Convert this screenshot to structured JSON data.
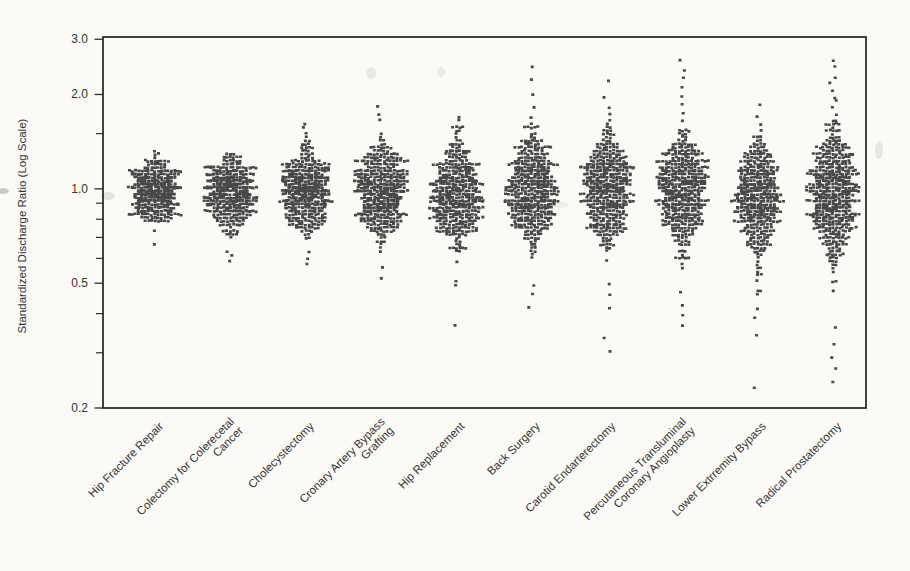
{
  "figure": {
    "background": "#fbfaf7",
    "frame_color": "#2d2d2d",
    "dot_color": "#3a3a3a",
    "text_color": "#333333",
    "ylabel": "Standardized Discharge Ratio (Log Scale)"
  },
  "chart_data": {
    "type": "beeswarm",
    "title": "",
    "xlabel": "",
    "ylabel": "Standardized Discharge Ratio (Log Scale)",
    "yscale": "log10",
    "ylim": [
      0.2,
      3.0
    ],
    "y_axis": {
      "ticks": [
        {
          "label": "3.0",
          "value": 3.0
        },
        {
          "label": "2.0",
          "value": 2.0
        },
        {
          "label": "1.0",
          "value": 1.0
        },
        {
          "label": "0.5",
          "value": 0.5
        },
        {
          "label": "0.2",
          "value": 0.2
        }
      ],
      "minor_ticks": [
        1.5,
        0.9,
        0.8,
        0.7,
        0.6,
        0.4,
        0.3
      ]
    },
    "categories": [
      "Hip Fracture Repair",
      "Colectomy for Colerecetal Cancer",
      "Cholecystectomy",
      "Cronary Artery Bypass Grafting",
      "Hip Replacement",
      "Back Surgery",
      "Carotid Endarterectomy",
      "Percutaneous Transluminal Coronary Angioplasty",
      "Lower Extrremity Bypass",
      "Radical Prostatectomy"
    ],
    "series": [
      {
        "label": "Hip Fracture Repair",
        "lines": [
          "Hip Fracture Repair"
        ],
        "n": 460,
        "center": 0.985,
        "sigma": 0.048,
        "dense": [
          0.78,
          1.31
        ],
        "high": [],
        "low": [
          0.73,
          0.66
        ],
        "seed": 7
      },
      {
        "label": "Colectomy for Colerecetal Cancer",
        "lines": [
          "Colectomy for Colerecetal",
          "Cancer"
        ],
        "n": 470,
        "center": 0.97,
        "sigma": 0.056,
        "dense": [
          0.68,
          1.3
        ],
        "high": [],
        "low": [
          0.64,
          0.61,
          0.585
        ],
        "seed": 19
      },
      {
        "label": "Cholecystectomy",
        "lines": [
          "Cholecystectomy"
        ],
        "n": 490,
        "center": 0.985,
        "sigma": 0.063,
        "dense": [
          0.69,
          1.52
        ],
        "high": [
          1.62,
          1.57
        ],
        "low": [
          0.625,
          0.6,
          0.575
        ],
        "seed": 33
      },
      {
        "label": "Cronary Artery Bypass Grafting",
        "lines": [
          "Cronary Artery Bypass",
          "Grafting"
        ],
        "n": 490,
        "center": 0.975,
        "sigma": 0.072,
        "dense": [
          0.61,
          1.58
        ],
        "high": [
          1.84,
          1.74,
          1.66
        ],
        "low": [
          0.565,
          0.525
        ],
        "seed": 47
      },
      {
        "label": "Hip Replacement",
        "lines": [
          "Hip Replacement"
        ],
        "n": 490,
        "center": 0.97,
        "sigma": 0.082,
        "dense": [
          0.55,
          1.6
        ],
        "high": [
          1.7,
          1.65
        ],
        "low": [
          0.51,
          0.49,
          0.365
        ],
        "seed": 59
      },
      {
        "label": "Back Surgery",
        "lines": [
          "Back Surgery"
        ],
        "n": 500,
        "center": 1.0,
        "sigma": 0.088,
        "dense": [
          0.6,
          1.62
        ],
        "high": [
          2.42,
          2.2,
          2.01,
          1.84,
          1.7
        ],
        "low": [
          0.5,
          0.455,
          0.415
        ],
        "seed": 71
      },
      {
        "label": "Carotid Endarterectomy",
        "lines": [
          "Carotid Endarterectomy"
        ],
        "n": 490,
        "center": 0.985,
        "sigma": 0.09,
        "dense": [
          0.56,
          1.6
        ],
        "high": [
          2.2,
          1.95,
          1.84,
          1.74,
          1.66
        ],
        "low": [
          0.5,
          0.46,
          0.42,
          0.335,
          0.305
        ],
        "seed": 83
      },
      {
        "label": "Percutaneous Transluminal Coronary Angioplasty",
        "lines": [
          "Percutaneous Transluminal",
          "Coronary Angioplasty"
        ],
        "n": 500,
        "center": 0.985,
        "sigma": 0.094,
        "dense": [
          0.5,
          1.56
        ],
        "high": [
          2.55,
          2.4,
          2.27,
          2.12,
          1.98,
          1.86,
          1.75,
          1.65
        ],
        "low": [
          0.465,
          0.43,
          0.4,
          0.37
        ],
        "seed": 97
      },
      {
        "label": "Lower Extrremity Bypass",
        "lines": [
          "Lower Extrremity Bypass"
        ],
        "n": 470,
        "center": 0.95,
        "sigma": 0.094,
        "dense": [
          0.46,
          1.48
        ],
        "high": [
          1.88,
          1.71,
          1.61,
          1.53
        ],
        "low": [
          0.42,
          0.385,
          0.345,
          0.23
        ],
        "seed": 109
      },
      {
        "label": "Radical Prostatectomy",
        "lines": [
          "Radical Prostatectomy"
        ],
        "n": 560,
        "center": 0.975,
        "sigma": 0.105,
        "dense": [
          0.4,
          1.66
        ],
        "high": [
          2.6,
          2.43,
          2.3,
          2.18,
          2.07,
          1.97,
          1.89,
          1.81,
          1.73
        ],
        "low": [
          0.355,
          0.315,
          0.285,
          0.265,
          0.24
        ],
        "seed": 121
      }
    ],
    "scan_artifacts": [
      {
        "x": 108,
        "y": 196,
        "rx": 7,
        "ry": 4,
        "opacity": 0.22
      },
      {
        "x": 3,
        "y": 191,
        "rx": 6,
        "ry": 3,
        "opacity": 0.45
      },
      {
        "x": 371,
        "y": 73,
        "rx": 5,
        "ry": 6,
        "opacity": 0.16
      },
      {
        "x": 441,
        "y": 72,
        "rx": 4,
        "ry": 5,
        "opacity": 0.14
      },
      {
        "x": 879,
        "y": 150,
        "rx": 4,
        "ry": 9,
        "opacity": 0.18
      },
      {
        "x": 560,
        "y": 205,
        "rx": 9,
        "ry": 3,
        "opacity": 0.1
      }
    ]
  }
}
